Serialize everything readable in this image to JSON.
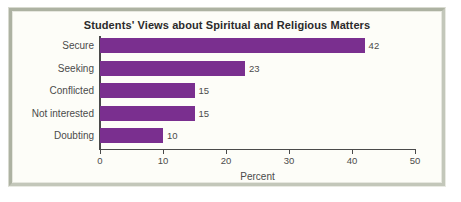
{
  "frame": {
    "border_color": "#b6baac",
    "background_color": "#fdfdf8"
  },
  "chart_data": {
    "type": "bar",
    "orientation": "horizontal",
    "title": "Students' Views about Spiritual and Religious Matters",
    "xlabel": "Percent",
    "ylabel": "",
    "categories": [
      "Secure",
      "Seeking",
      "Conflicted",
      "Not interested",
      "Doubting"
    ],
    "values": [
      42,
      23,
      15,
      15,
      10
    ],
    "value_labels": [
      "42",
      "23",
      "15",
      "15",
      "10"
    ],
    "xlim": [
      0,
      50
    ],
    "xticks": [
      0,
      10,
      20,
      30,
      40,
      50
    ],
    "xtick_labels": [
      "0",
      "10",
      "20",
      "30",
      "40",
      "50"
    ],
    "grid": false,
    "legend": null,
    "bar_color": "#7a2f8f",
    "axis_color": "#4a4a4a",
    "text_color": "#4b4b4b"
  }
}
